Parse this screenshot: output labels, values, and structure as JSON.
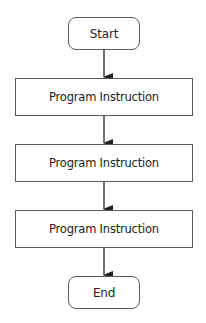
{
  "diagram": {
    "type": "flowchart",
    "direction": "top-to-bottom",
    "nodes": [
      {
        "id": "start",
        "shape": "rounded-rect",
        "label": "Start"
      },
      {
        "id": "step1",
        "shape": "rect",
        "label": "Program Instruction"
      },
      {
        "id": "step2",
        "shape": "rect",
        "label": "Program Instruction"
      },
      {
        "id": "step3",
        "shape": "rect",
        "label": "Program Instruction"
      },
      {
        "id": "end",
        "shape": "rounded-rect",
        "label": "End"
      }
    ],
    "edges": [
      {
        "from": "start",
        "to": "step1"
      },
      {
        "from": "step1",
        "to": "step2"
      },
      {
        "from": "step2",
        "to": "step3"
      },
      {
        "from": "step3",
        "to": "end"
      }
    ],
    "colors": {
      "stroke": "#5a5a5a",
      "arrow": "#222222",
      "text": "#222222",
      "background": "#ffffff"
    }
  }
}
